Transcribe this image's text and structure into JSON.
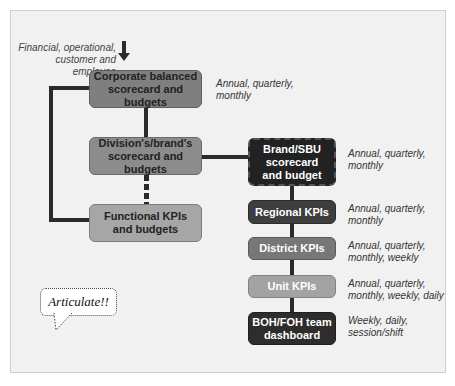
{
  "diagram": {
    "input_label": "Financial, operational,\ncustomer and employee",
    "boxes": {
      "corporate": "Corporate balanced\nscorecard and budgets",
      "division": "Division's/brand's\nscorecard and budgets",
      "functional": "Functional KPIs\nand budgets",
      "brand": "Brand/SBU\nscorecard\nand budget",
      "regional": "Regional KPIs",
      "district": "District KPIs",
      "unit": "Unit KPIs",
      "boh": "BOH/FOH team\ndashboard"
    },
    "frequencies": {
      "corporate": "Annual, quarterly,\nmonthly",
      "brand": "Annual, quarterly,\nmonthly",
      "regional": "Annual, quarterly,\nmonthly",
      "district": "Annual, quarterly,\nmonthly, weekly",
      "unit": "Annual, quarterly,\nmonthly, weekly, daily",
      "boh": "Weekly, daily,\nsession/shift"
    },
    "speech_bubble": "Articulate!!"
  }
}
